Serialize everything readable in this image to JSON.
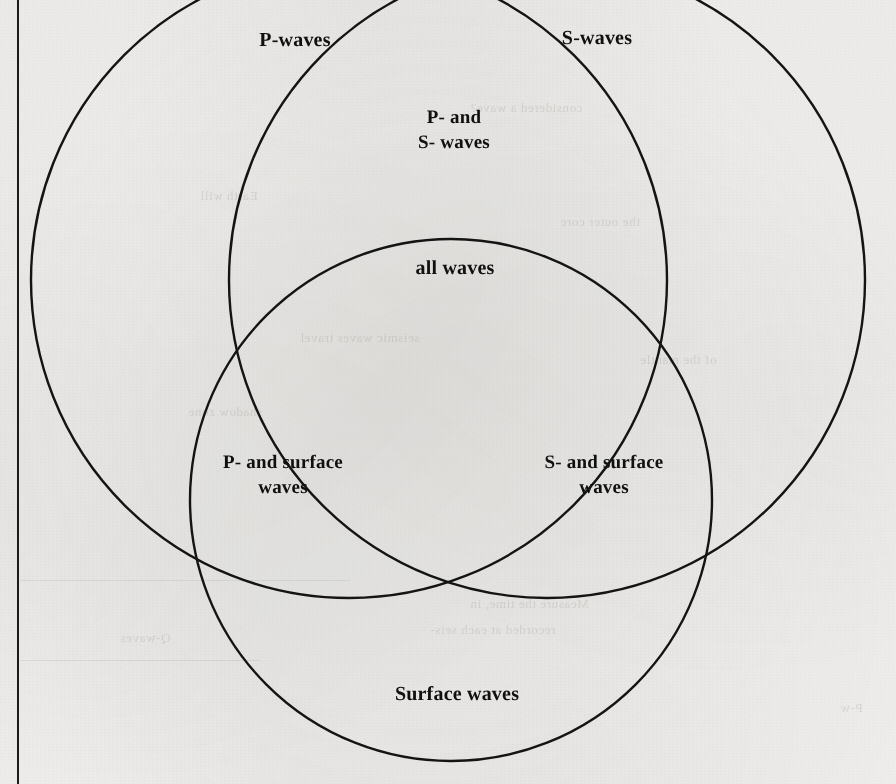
{
  "page": {
    "width": 896,
    "height": 784,
    "background_color": "#f3f2f0",
    "ink_color": "#141414",
    "margin_rule": "vertical-margin-rule"
  },
  "diagram": {
    "type": "venn",
    "set_count": 3,
    "title_visible": false,
    "circles": [
      {
        "id": "p-waves",
        "label": "P-waves",
        "cx": 349,
        "cy": 280,
        "r": 318
      },
      {
        "id": "s-waves",
        "label": "S-waves",
        "cx": 547,
        "cy": 280,
        "r": 318
      },
      {
        "id": "surface-waves",
        "label": "Surface waves",
        "cx": 451,
        "cy": 500,
        "r": 261
      }
    ],
    "regions": [
      {
        "id": "p-only",
        "label": "P-waves",
        "x": 295,
        "y": 40,
        "size": "lbl-lg"
      },
      {
        "id": "s-only",
        "label": "S-waves",
        "x": 597,
        "y": 38,
        "size": "lbl-lg"
      },
      {
        "id": "p-and-s",
        "label": "P- and\nS- waves",
        "x": 454,
        "y": 130,
        "size": "lbl-md"
      },
      {
        "id": "all-three",
        "label": "all waves",
        "x": 455,
        "y": 268,
        "size": "lbl-lg"
      },
      {
        "id": "p-and-surface",
        "label": "P- and surface\nwaves",
        "x": 283,
        "y": 475,
        "size": "lbl-md"
      },
      {
        "id": "s-and-surface",
        "label": "S- and surface\nwaves",
        "x": 604,
        "y": 475,
        "size": "lbl-md"
      },
      {
        "id": "surface-only",
        "label": "Surface waves",
        "x": 457,
        "y": 694,
        "size": "lbl-lg"
      }
    ]
  },
  "bleed_through": {
    "note": "faint mirrored text showing through from the reverse side of the scanned page",
    "lines": [
      {
        "text": "considered a wave?",
        "x": 470,
        "y": 100
      },
      {
        "text": "Earth will",
        "x": 200,
        "y": 188
      },
      {
        "text": "the outer core",
        "x": 560,
        "y": 214
      },
      {
        "text": "seismic waves travel",
        "x": 300,
        "y": 330
      },
      {
        "text": "of the mantle",
        "x": 640,
        "y": 352
      },
      {
        "text": "shadow zone",
        "x": 188,
        "y": 404
      },
      {
        "text": "Measure the time, in",
        "x": 470,
        "y": 596
      },
      {
        "text": "recorded at each seis-",
        "x": 430,
        "y": 622
      },
      {
        "text": "Q-waves",
        "x": 120,
        "y": 630
      },
      {
        "text": "P-w",
        "x": 840,
        "y": 700
      }
    ],
    "rules": [
      {
        "x": 20,
        "y": 580,
        "width": 330
      },
      {
        "x": 20,
        "y": 660,
        "width": 240
      }
    ]
  }
}
